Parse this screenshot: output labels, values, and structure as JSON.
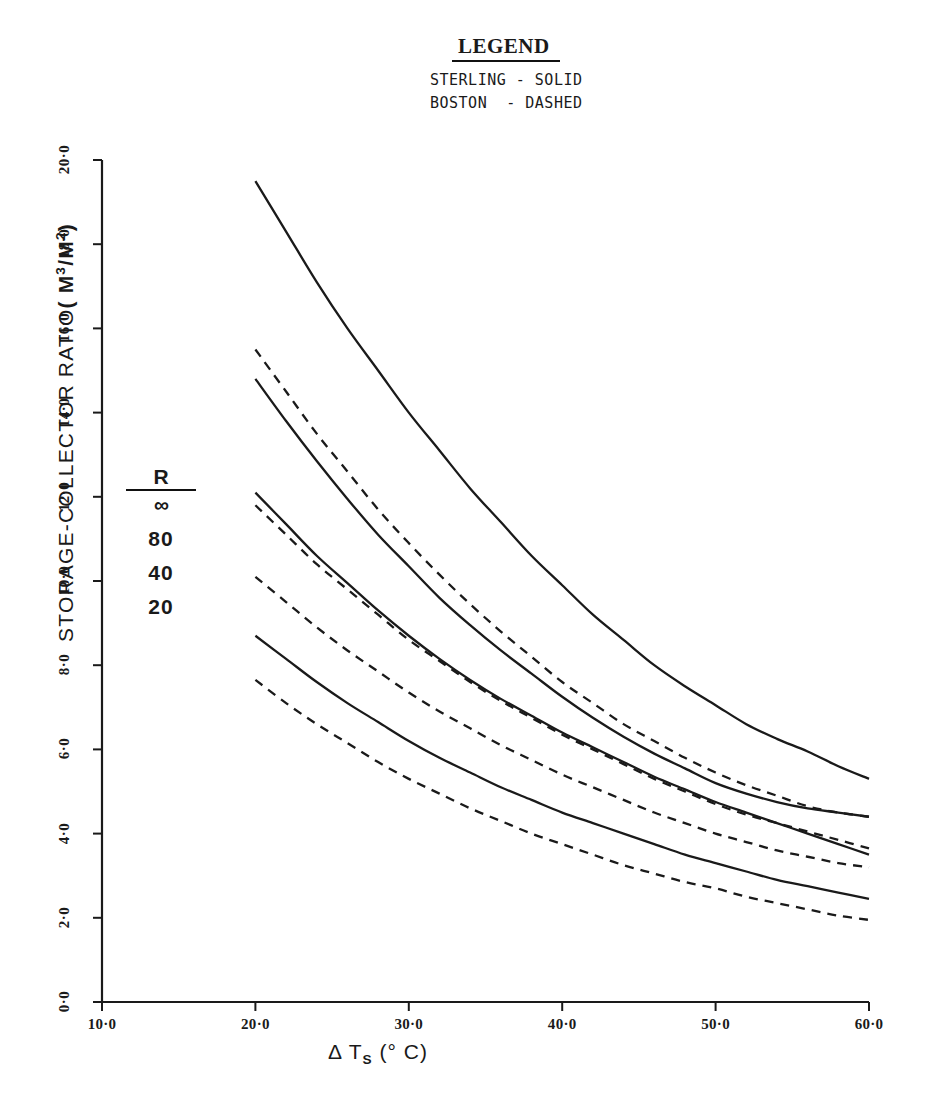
{
  "legend": {
    "title": "LEGEND",
    "lines": [
      "STERLING - SOLID",
      "BOSTON  - DASHED"
    ]
  },
  "annotation": {
    "numerator": "R",
    "denominator": "∞",
    "values": [
      "80",
      "40",
      "20"
    ]
  },
  "axes": {
    "ylabel_prefix": "STORAGE-COLLECTOR RATIO",
    "ylabel_units_open": "( M",
    "ylabel_units_sup1": "3",
    "ylabel_units_mid": "/M",
    "ylabel_units_sup2": "2",
    "ylabel_units_close": ")",
    "xlabel_delta": "Δ",
    "xlabel_var": "T",
    "xlabel_sub": "S",
    "xlabel_units": "(° C)",
    "ytick_labels": [
      "0·0",
      "2·0",
      "4·0",
      "6·0",
      "8·0",
      "10·0",
      "12·0",
      "14·0",
      "16·0",
      "18·0",
      "20·0"
    ],
    "xtick_labels": [
      "10·0",
      "20·0",
      "30·0",
      "40·0",
      "50·0",
      "60·0"
    ]
  },
  "chart_data": {
    "type": "line",
    "title": "",
    "xlabel": "Δ T_S (° C)",
    "ylabel": "STORAGE-COLLECTOR RATIO (M³/M²)",
    "xlim": [
      10.0,
      60.0
    ],
    "ylim": [
      0.0,
      20.0
    ],
    "xticks": [
      10.0,
      20.0,
      30.0,
      40.0,
      50.0,
      60.0
    ],
    "yticks": [
      0.0,
      2.0,
      4.0,
      6.0,
      8.0,
      10.0,
      12.0,
      14.0,
      16.0,
      18.0,
      20.0
    ],
    "grid": false,
    "legend_position": "top-center-external",
    "legend_entries": [
      "STERLING - SOLID",
      "BOSTON - DASHED"
    ],
    "annotations": [
      "R/∞",
      "80",
      "40",
      "20"
    ],
    "series": [
      {
        "name": "Sterling R=∞",
        "location": "STERLING",
        "R": "∞",
        "style": "solid",
        "color": "#1a1a1a",
        "x": [
          20,
          22,
          24,
          26,
          28,
          30,
          32,
          34,
          36,
          38,
          40,
          42,
          44,
          46,
          48,
          50,
          52,
          54,
          56,
          58,
          60
        ],
        "y": [
          19.5,
          18.3,
          17.1,
          16.0,
          15.0,
          14.0,
          13.1,
          12.2,
          11.4,
          10.6,
          9.9,
          9.2,
          8.6,
          8.0,
          7.5,
          7.05,
          6.6,
          6.25,
          5.95,
          5.6,
          5.3
        ]
      },
      {
        "name": "Boston R=∞",
        "location": "BOSTON",
        "R": "∞",
        "style": "dashed",
        "color": "#1a1a1a",
        "x": [
          20,
          22,
          24,
          26,
          28,
          30,
          32,
          34,
          36,
          38,
          40,
          42,
          44,
          46,
          48,
          50,
          52,
          54,
          56,
          58,
          60
        ],
        "y": [
          15.5,
          14.5,
          13.5,
          12.6,
          11.7,
          10.9,
          10.15,
          9.45,
          8.8,
          8.2,
          7.6,
          7.1,
          6.6,
          6.2,
          5.8,
          5.45,
          5.15,
          4.9,
          4.65,
          4.5,
          4.4
        ]
      },
      {
        "name": "Sterling R=80",
        "location": "STERLING",
        "R": "80",
        "style": "solid",
        "color": "#1a1a1a",
        "x": [
          20,
          22,
          24,
          26,
          28,
          30,
          32,
          34,
          36,
          38,
          40,
          42,
          44,
          46,
          48,
          50,
          52,
          54,
          56,
          58,
          60
        ],
        "y": [
          14.8,
          13.8,
          12.85,
          11.95,
          11.1,
          10.35,
          9.6,
          8.95,
          8.35,
          7.8,
          7.25,
          6.75,
          6.3,
          5.9,
          5.55,
          5.2,
          4.95,
          4.75,
          4.6,
          4.5,
          4.4
        ]
      },
      {
        "name": "Boston R=80",
        "location": "BOSTON",
        "R": "80",
        "style": "dashed",
        "color": "#1a1a1a",
        "x": [
          20,
          22,
          24,
          26,
          28,
          30,
          32,
          34,
          36,
          38,
          40,
          42,
          44,
          46,
          48,
          50,
          52,
          54,
          56,
          58,
          60
        ],
        "y": [
          11.8,
          11.1,
          10.4,
          9.8,
          9.2,
          8.6,
          8.1,
          7.6,
          7.15,
          6.75,
          6.35,
          6.0,
          5.65,
          5.3,
          5.0,
          4.7,
          4.45,
          4.25,
          4.05,
          3.85,
          3.65
        ]
      },
      {
        "name": "Sterling R=40",
        "location": "STERLING",
        "R": "40",
        "style": "solid",
        "color": "#1a1a1a",
        "x": [
          20,
          22,
          24,
          26,
          28,
          30,
          32,
          34,
          36,
          38,
          40,
          42,
          44,
          46,
          48,
          50,
          52,
          54,
          56,
          58,
          60
        ],
        "y": [
          12.1,
          11.35,
          10.6,
          9.95,
          9.3,
          8.7,
          8.15,
          7.65,
          7.2,
          6.8,
          6.4,
          6.05,
          5.7,
          5.35,
          5.05,
          4.75,
          4.5,
          4.25,
          4.0,
          3.75,
          3.5
        ]
      },
      {
        "name": "Boston R=40",
        "location": "BOSTON",
        "R": "40",
        "style": "dashed",
        "color": "#1a1a1a",
        "x": [
          20,
          22,
          24,
          26,
          28,
          30,
          32,
          34,
          36,
          38,
          40,
          42,
          44,
          46,
          48,
          50,
          52,
          54,
          56,
          58,
          60
        ],
        "y": [
          10.1,
          9.5,
          8.9,
          8.35,
          7.85,
          7.35,
          6.9,
          6.5,
          6.1,
          5.75,
          5.4,
          5.1,
          4.8,
          4.5,
          4.25,
          4.0,
          3.8,
          3.6,
          3.45,
          3.3,
          3.2
        ]
      },
      {
        "name": "Sterling R=20",
        "location": "STERLING",
        "R": "20",
        "style": "solid",
        "color": "#1a1a1a",
        "x": [
          20,
          22,
          24,
          26,
          28,
          30,
          32,
          34,
          36,
          38,
          40,
          42,
          44,
          46,
          48,
          50,
          52,
          54,
          56,
          58,
          60
        ],
        "y": [
          8.7,
          8.15,
          7.6,
          7.1,
          6.65,
          6.2,
          5.8,
          5.45,
          5.1,
          4.8,
          4.5,
          4.25,
          4.0,
          3.75,
          3.5,
          3.3,
          3.1,
          2.9,
          2.75,
          2.6,
          2.45
        ]
      },
      {
        "name": "Boston R=20",
        "location": "BOSTON",
        "R": "20",
        "style": "dashed",
        "color": "#1a1a1a",
        "x": [
          20,
          22,
          24,
          26,
          28,
          30,
          32,
          34,
          36,
          38,
          40,
          42,
          44,
          46,
          48,
          50,
          52,
          54,
          56,
          58,
          60
        ],
        "y": [
          7.65,
          7.1,
          6.6,
          6.15,
          5.7,
          5.3,
          4.95,
          4.6,
          4.3,
          4.0,
          3.75,
          3.5,
          3.25,
          3.05,
          2.85,
          2.7,
          2.5,
          2.35,
          2.2,
          2.05,
          1.95
        ]
      }
    ]
  }
}
